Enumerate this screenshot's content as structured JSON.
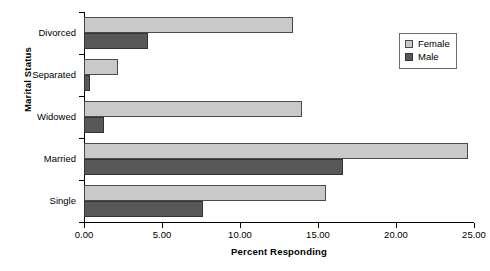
{
  "chart_data": {
    "type": "bar",
    "orientation": "horizontal",
    "title": "",
    "xlabel": "Percent Responding",
    "ylabel": "Marital Status",
    "categories": [
      "Divorced",
      "Separated",
      "Widowed",
      "Married",
      "Single"
    ],
    "series": [
      {
        "name": "Female",
        "color": "#c9c9c9",
        "values": [
          13.4,
          2.2,
          14.0,
          24.6,
          15.5
        ]
      },
      {
        "name": "Male",
        "color": "#585858",
        "values": [
          4.1,
          0.4,
          1.3,
          16.6,
          7.6
        ]
      }
    ],
    "xlim": [
      0,
      25
    ],
    "xticks": [
      0,
      5,
      10,
      15,
      20,
      25
    ],
    "xtick_labels": [
      "0.00",
      "5.00",
      "10.00",
      "15.00",
      "20.00",
      "25.00"
    ],
    "grid": false,
    "legend_position": "top-right",
    "legend_entries": [
      "Female",
      "Male"
    ]
  }
}
